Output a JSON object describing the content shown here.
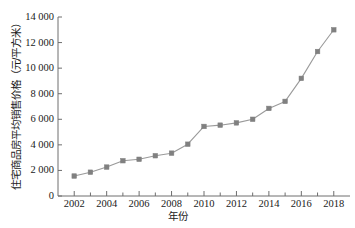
{
  "chart_data": {
    "type": "line",
    "title": "",
    "xlabel": "年份",
    "ylabel": "住宅商品房平均销售价格（元/平方米）",
    "xlim": [
      2001,
      2019
    ],
    "ylim": [
      0,
      14000
    ],
    "grid": false,
    "legend": null,
    "marker": "square",
    "series_color": "#808080",
    "line_color": "#9a9a9a",
    "axis_color": "#6e6e6e",
    "x": [
      2002,
      2003,
      2004,
      2005,
      2006,
      2007,
      2008,
      2009,
      2010,
      2011,
      2012,
      2013,
      2014,
      2015,
      2016,
      2017,
      2018
    ],
    "values": [
      1560,
      1860,
      2260,
      2760,
      2870,
      3150,
      3350,
      4050,
      5440,
      5540,
      5720,
      6000,
      6850,
      7400,
      9200,
      11300,
      13000
    ],
    "xticks": [
      2002,
      2004,
      2006,
      2008,
      2010,
      2012,
      2014,
      2016,
      2018
    ],
    "xtick_labels": [
      "2002",
      "2004",
      "2006",
      "2008",
      "2010",
      "2012",
      "2014",
      "2016",
      "2018"
    ],
    "yticks": [
      0,
      2000,
      4000,
      6000,
      8000,
      10000,
      12000,
      14000
    ],
    "ytick_labels": [
      "0",
      "2 000",
      "4 000",
      "6 000",
      "8 000",
      "10 000",
      "12 000",
      "14 000"
    ],
    "x_minor_ticks": [
      2002,
      2003,
      2004,
      2005,
      2006,
      2007,
      2008,
      2009,
      2010,
      2011,
      2012,
      2013,
      2014,
      2015,
      2016,
      2017,
      2018
    ]
  }
}
